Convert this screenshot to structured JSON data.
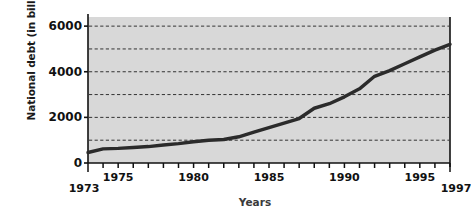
{
  "chart_data": {
    "type": "line",
    "title": "",
    "xlabel": "Years",
    "ylabel": "National debt (in billions)",
    "xlim": [
      1973,
      1997
    ],
    "ylim": [
      0,
      6400
    ],
    "grid": true,
    "grid_values": [
      1000,
      2000,
      3000,
      4000,
      5000,
      6000
    ],
    "legend": "none",
    "y_ticks": [
      "0",
      "2000",
      "4000",
      "6000"
    ],
    "y_tick_values": [
      0,
      2000,
      4000,
      6000
    ],
    "x_ticks": [
      "1973",
      "1975",
      "1980",
      "1985",
      "1990",
      "1995",
      "1997"
    ],
    "x_tick_values": [
      1973,
      1975,
      1980,
      1985,
      1990,
      1995,
      1997
    ],
    "x": [
      1973,
      1974,
      1975,
      1976,
      1977,
      1978,
      1979,
      1980,
      1981,
      1982,
      1983,
      1984,
      1985,
      1986,
      1987,
      1988,
      1989,
      1990,
      1991,
      1992,
      1993,
      1994,
      1995,
      1996,
      1997
    ],
    "values": [
      460,
      620,
      640,
      680,
      720,
      790,
      850,
      930,
      1000,
      1030,
      1150,
      1350,
      1550,
      1750,
      1950,
      2400,
      2600,
      2900,
      3250,
      3800,
      4050,
      4350,
      4650,
      4950,
      5200
    ],
    "series": [
      {
        "name": "National debt",
        "color": "#2b2b2b",
        "values": [
          460,
          620,
          640,
          680,
          720,
          790,
          850,
          930,
          1000,
          1030,
          1150,
          1350,
          1550,
          1750,
          1950,
          2400,
          2600,
          2900,
          3250,
          3800,
          4050,
          4350,
          4650,
          4950,
          5200
        ]
      }
    ],
    "plot_bg": "#d8d8d8",
    "line_color": "#2b2b2b",
    "grid_color": "#333333"
  }
}
